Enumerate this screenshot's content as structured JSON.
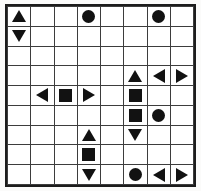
{
  "puzzle": {
    "title": "Shape Grid Puzzle",
    "columns": 8,
    "rows": 9,
    "colors": {
      "shape_fill": "#121212",
      "grid_line": "#3d3d3d",
      "frame_border": "#1c1c1c",
      "cell_background": "#ffffff",
      "page_background": "#fbfbfa"
    },
    "shape_legend": {
      "circle": "filled-circle",
      "square": "filled-square",
      "tri-up": "filled-triangle-up",
      "tri-down": "filled-triangle-down",
      "tri-left": "filled-triangle-left",
      "tri-right": "filled-triangle-right",
      "empty": "empty-cell"
    },
    "cells": [
      [
        "tri-up",
        "empty",
        "empty",
        "circle",
        "empty",
        "empty",
        "circle",
        "empty"
      ],
      [
        "tri-down",
        "empty",
        "empty",
        "empty",
        "empty",
        "empty",
        "empty",
        "empty"
      ],
      [
        "empty",
        "empty",
        "empty",
        "empty",
        "empty",
        "empty",
        "empty",
        "empty"
      ],
      [
        "empty",
        "empty",
        "empty",
        "empty",
        "empty",
        "tri-up",
        "tri-left",
        "tri-right"
      ],
      [
        "empty",
        "tri-left",
        "square",
        "tri-right",
        "empty",
        "square",
        "empty",
        "empty"
      ],
      [
        "empty",
        "empty",
        "empty",
        "empty",
        "empty",
        "square",
        "circle",
        "empty"
      ],
      [
        "empty",
        "empty",
        "empty",
        "tri-up",
        "empty",
        "tri-down",
        "empty",
        "empty"
      ],
      [
        "empty",
        "empty",
        "empty",
        "square",
        "empty",
        "empty",
        "empty",
        "empty"
      ],
      [
        "empty",
        "empty",
        "empty",
        "tri-down",
        "empty",
        "circle",
        "tri-left",
        "tri-right"
      ]
    ]
  }
}
